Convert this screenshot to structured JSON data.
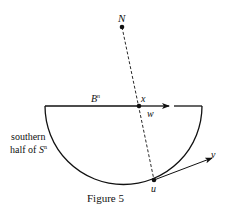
{
  "figure": {
    "caption": "Figure 5",
    "labels": {
      "N": "N",
      "B": "B",
      "B_sup": "n",
      "x": "x",
      "w": "w",
      "u": "u",
      "v": "v",
      "region_line1": "southern",
      "region_line2_prefix": "half of ",
      "region_S": "S",
      "region_S_sup": "n"
    },
    "colors": {
      "stroke": "#111111",
      "background": "#ffffff"
    }
  }
}
